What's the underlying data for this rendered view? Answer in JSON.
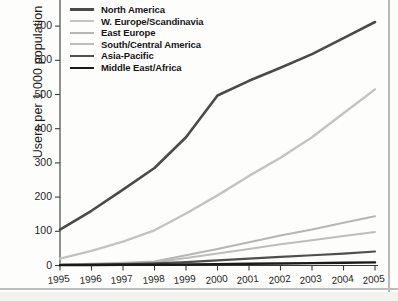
{
  "chart_data": {
    "type": "line",
    "title": "",
    "xlabel": "",
    "ylabel": "Users per 1,000 population",
    "x": [
      1995,
      1996,
      1997,
      1998,
      1999,
      2000,
      2001,
      2002,
      2003,
      2004,
      2005
    ],
    "xtick_labels": [
      "1995",
      "1996",
      "1997",
      "1998",
      "1999",
      "2000",
      "2001",
      "2002",
      "2003",
      "2004",
      "2005"
    ],
    "ytick_labels": [
      "0",
      "100",
      "200",
      "300",
      "400",
      "500",
      "600",
      "700"
    ],
    "yticks": [
      0,
      100,
      200,
      300,
      400,
      500,
      600,
      700
    ],
    "ylim": [
      0,
      730
    ],
    "xlim": [
      1995,
      2005
    ],
    "grid": false,
    "legend_position": "top-left",
    "series": [
      {
        "name": "North America",
        "color": "#4a4a4a",
        "width": 2.6,
        "values": [
          105,
          160,
          222,
          285,
          375,
          497,
          540,
          578,
          618,
          665,
          712
        ]
      },
      {
        "name": "W. Europe/Scandinavia",
        "color": "#c3c3c3",
        "width": 2.4,
        "values": [
          20,
          43,
          70,
          103,
          152,
          205,
          262,
          315,
          375,
          445,
          515
        ]
      },
      {
        "name": "East Europe",
        "color": "#b6b6b6",
        "width": 2.0,
        "values": [
          3,
          5,
          8,
          12,
          30,
          48,
          68,
          88,
          105,
          125,
          144
        ]
      },
      {
        "name": "South/Central America",
        "color": "#bdbdbd",
        "width": 2.0,
        "values": [
          2,
          3,
          5,
          9,
          22,
          35,
          48,
          62,
          74,
          86,
          98
        ]
      },
      {
        "name": "Asia-Pacific",
        "color": "#4f4f4f",
        "width": 2.2,
        "values": [
          2,
          3,
          4,
          6,
          10,
          15,
          20,
          25,
          30,
          35,
          41
        ]
      },
      {
        "name": "Middle East/Africa",
        "color": "#1a1a1a",
        "width": 2.4,
        "values": [
          1,
          1,
          2,
          2,
          3,
          4,
          5,
          6,
          7,
          8,
          9
        ]
      }
    ]
  },
  "axis": {
    "y_title": "Users per 1,000 population"
  }
}
